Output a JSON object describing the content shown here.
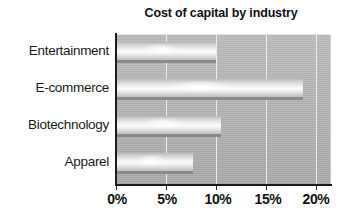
{
  "chart_data": {
    "type": "bar",
    "orientation": "horizontal",
    "title": "Cost of capital by industry",
    "xlabel": "",
    "ylabel": "",
    "categories": [
      "Entertainment",
      "E-commerce",
      "Biotechnology",
      "Apparel"
    ],
    "values": [
      10.0,
      18.7,
      10.5,
      7.7
    ],
    "value_unit": "%",
    "xlim": [
      0,
      20
    ],
    "xticks": [
      0,
      5,
      10,
      15,
      20
    ],
    "xtick_labels": [
      "0%",
      "5%",
      "10%",
      "15%",
      "20%"
    ],
    "grid": "vertical",
    "legend": "none",
    "series": [
      {
        "name": "Cost of capital",
        "values": [
          10.0,
          18.7,
          10.5,
          7.7
        ]
      }
    ],
    "colors": {
      "plot_background": "#b5b5b5",
      "bar_fill": "#ededed",
      "bar_shadow": "#8a8a8a",
      "gridline": "#eceaea",
      "axis": "#1b1b1b",
      "text": "#111111",
      "page_background": "#ffffff"
    }
  }
}
